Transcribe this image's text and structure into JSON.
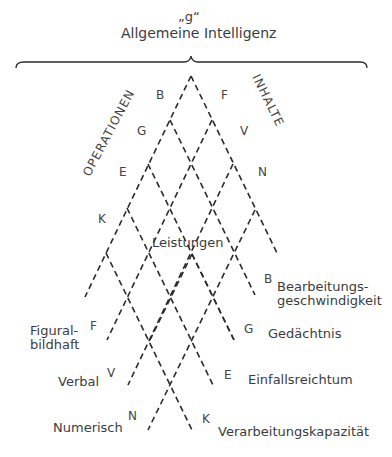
{
  "header": {
    "g_label": "„g“",
    "title": "Allgemeine Intelligenz"
  },
  "axes": {
    "left": "OPERATIONEN",
    "right": "INHALTE"
  },
  "center_label": "Leistungen",
  "operations_top": [
    "B",
    "G",
    "E",
    "K"
  ],
  "contents_top": [
    "F",
    "V",
    "N"
  ],
  "contents_bottom": [
    {
      "code": "F",
      "label_line1": "Figural-",
      "label_line2": "bildhaft"
    },
    {
      "code": "V",
      "label": "Verbal"
    },
    {
      "code": "N",
      "label": "Numerisch"
    }
  ],
  "operations_bottom": [
    {
      "code": "B",
      "label_line1": "Bearbeitungs-",
      "label_line2": "geschwindigkeit"
    },
    {
      "code": "G",
      "label": "Gedächtnis"
    },
    {
      "code": "E",
      "label": "Einfallsreichtum"
    },
    {
      "code": "K",
      "label": "Verarbeitungskapazität"
    }
  ],
  "colors": {
    "line": "#2b2b2b",
    "text": "#3c3c3c",
    "background": "#ffffff"
  }
}
